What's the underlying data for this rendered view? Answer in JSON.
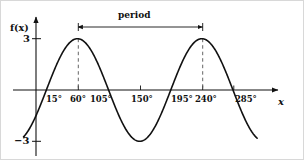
{
  "figure": {
    "background_color": "#ffffff",
    "stroke_color": "#111111",
    "axis_color": "#111111",
    "dashed_color": "#555555"
  },
  "axes": {
    "y_axis_label": "f(x)",
    "x_axis_label": "x",
    "y_tick_top": "3",
    "y_tick_bottom": "−3"
  },
  "annotation": {
    "period_label": "period"
  },
  "chart_data": {
    "type": "line",
    "title": "",
    "subtitle": "",
    "xlabel": "x",
    "ylabel": "f(x)",
    "grid": false,
    "legend": false,
    "legend_position": "none",
    "xlim": [
      -18,
      320
    ],
    "ylim": [
      -3.9,
      3.9
    ],
    "x_tick_labels": [
      "15°",
      "60°",
      "105°",
      "150°",
      "195°",
      "240°",
      "285°"
    ],
    "x_tick_values": [
      15,
      60,
      105,
      150,
      195,
      240,
      285
    ],
    "y_tick_labels": [
      "3",
      "−3"
    ],
    "y_tick_values": [
      3,
      -3
    ],
    "series": [
      {
        "name": "f(x)",
        "function": "3*cos(2*(x-60))",
        "amplitude": 3,
        "period": 180,
        "phase_degrees": 60,
        "midline": 0,
        "maxima_x": [
          60,
          240
        ],
        "maxima_y": [
          3,
          3
        ],
        "minima_x": [
          -30,
          150,
          330
        ],
        "minima_y": [
          -3,
          -3,
          -3
        ],
        "zeros_x": [
          15,
          105,
          195,
          285
        ],
        "y_intercept": -1.5,
        "x_start": -18,
        "x_end": 320,
        "values": [
          {
            "x": -18,
            "y": -2.3
          },
          {
            "x": -10,
            "y": -2.82
          },
          {
            "x": 0,
            "y": -1.5
          },
          {
            "x": 15,
            "y": 0.0
          },
          {
            "x": 30,
            "y": 1.5
          },
          {
            "x": 45,
            "y": 2.6
          },
          {
            "x": 60,
            "y": 3.0
          },
          {
            "x": 75,
            "y": 2.6
          },
          {
            "x": 90,
            "y": 1.5
          },
          {
            "x": 105,
            "y": 0.0
          },
          {
            "x": 120,
            "y": -1.5
          },
          {
            "x": 135,
            "y": -2.6
          },
          {
            "x": 150,
            "y": -3.0
          },
          {
            "x": 165,
            "y": -2.6
          },
          {
            "x": 180,
            "y": -1.5
          },
          {
            "x": 195,
            "y": 0.0
          },
          {
            "x": 210,
            "y": 1.5
          },
          {
            "x": 225,
            "y": 2.6
          },
          {
            "x": 240,
            "y": 3.0
          },
          {
            "x": 255,
            "y": 2.6
          },
          {
            "x": 270,
            "y": 1.5
          },
          {
            "x": 285,
            "y": 0.0
          },
          {
            "x": 300,
            "y": -1.5
          },
          {
            "x": 310,
            "y": -2.3
          },
          {
            "x": 320,
            "y": -2.82
          }
        ]
      }
    ],
    "annotations": [
      {
        "text": "period",
        "type": "double-headed-arrow",
        "from_x": 60,
        "to_x": 240,
        "y": 3.55
      }
    ],
    "guides": [
      {
        "type": "dashed-vertical",
        "x": 60,
        "from_y": 0,
        "to_y": 3
      },
      {
        "type": "dashed-vertical",
        "x": 240,
        "from_y": 0,
        "to_y": 3
      }
    ]
  }
}
